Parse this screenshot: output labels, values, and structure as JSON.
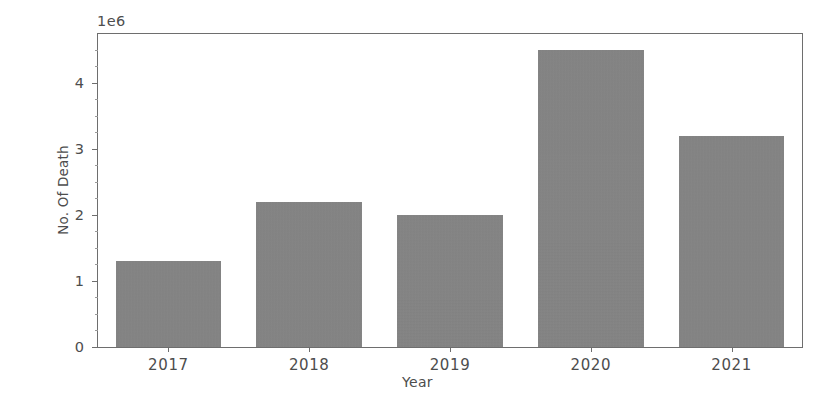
{
  "chart_data": {
    "type": "bar",
    "title": "",
    "xlabel": "Year",
    "ylabel": "No. Of Death",
    "categories": [
      "2017",
      "2018",
      "2019",
      "2020",
      "2021"
    ],
    "values": [
      1300000,
      2200000,
      2000000,
      4500000,
      3200000
    ],
    "y_offset_text": "1e6",
    "y_offset_multiplier": 1000000,
    "y_tick_labels": [
      "0",
      "1",
      "2",
      "3",
      "4"
    ],
    "y_tick_values": [
      0,
      1000000,
      2000000,
      3000000,
      4000000
    ],
    "y_minor_tick_values": [
      250000,
      500000,
      750000,
      1250000,
      1500000,
      1750000,
      2250000,
      2500000,
      2750000,
      3250000,
      3500000,
      3750000,
      4250000,
      4500000,
      4750000
    ],
    "ylim": [
      0,
      4740000
    ],
    "xlim": [
      0,
      5
    ],
    "grid": false,
    "legend": null,
    "bar_color": "#858585",
    "axis_color": "#6e6e6e",
    "text_color": "#4d4d4d",
    "background_color": "#ffffff",
    "bar_width_fraction": 0.75,
    "series": [
      {
        "name": "No. Of Death",
        "values": [
          1300000,
          2200000,
          2000000,
          4500000,
          3200000
        ]
      }
    ],
    "points": [
      {
        "category": "2017",
        "value": 1300000,
        "label": "1.3e6"
      },
      {
        "category": "2018",
        "value": 2200000,
        "label": "2.2e6"
      },
      {
        "category": "2019",
        "value": 2000000,
        "label": "2.0e6"
      },
      {
        "category": "2020",
        "value": 4500000,
        "label": "4.5e6"
      },
      {
        "category": "2021",
        "value": 3200000,
        "label": "3.2e6"
      }
    ]
  }
}
